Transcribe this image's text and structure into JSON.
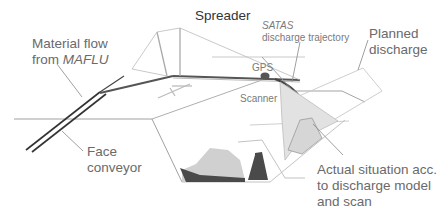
{
  "diagram": {
    "labels": {
      "spreader": "Spreader",
      "material_flow_line1": "Material flow",
      "material_flow_line2_prefix": "from ",
      "material_flow_line2_italic": "MAFLU",
      "satas_italic": "SATAS",
      "satas_line2": "discharge trajectory",
      "planned_line1": "Planned",
      "planned_line2": "discharge",
      "gps": "GPS",
      "scanner": "Scanner",
      "face_line1": "Face",
      "face_line2": "conveyor",
      "actual_line1": "Actual situation acc.",
      "actual_line2": "to discharge model",
      "actual_line3": "and scan"
    },
    "colors": {
      "line_light": "#b8b8b8",
      "line_dark": "#555555",
      "pile_dark": "#4a4a4a",
      "pile_light": "#d0d0d0",
      "text": "#6a6a6a"
    }
  }
}
